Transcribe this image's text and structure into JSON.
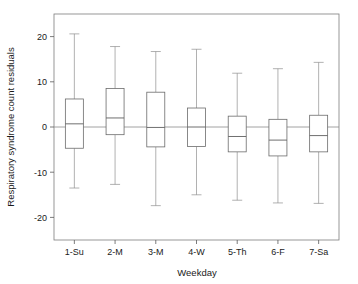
{
  "chart_data": {
    "type": "box",
    "title": "",
    "xlabel": "Weekday",
    "ylabel": "Respiratory syndrome count residuals",
    "categories": [
      "1-Su",
      "2-M",
      "3-M",
      "4-W",
      "5-Th",
      "6-F",
      "7-Sa"
    ],
    "ylim": [
      -25,
      25
    ],
    "yticks": [
      20,
      10,
      0,
      -10,
      -20
    ],
    "yticklabels": [
      "20",
      "10",
      "0",
      "-10",
      "-20"
    ],
    "grid": false,
    "legend": false,
    "zero_reference_line": 0,
    "boxes": [
      {
        "category": "1-Su",
        "whisker_low": -13.5,
        "q1": -4.7,
        "median": 0.7,
        "q3": 6.2,
        "whisker_high": 20.6
      },
      {
        "category": "2-M",
        "whisker_low": -12.7,
        "q1": -1.7,
        "median": 2.0,
        "q3": 8.5,
        "whisker_high": 17.8
      },
      {
        "category": "3-M",
        "whisker_low": -17.4,
        "q1": -4.4,
        "median": -0.1,
        "q3": 7.7,
        "whisker_high": 16.7
      },
      {
        "category": "4-W",
        "whisker_low": -15.0,
        "q1": -4.3,
        "median": 0.0,
        "q3": 4.2,
        "whisker_high": 17.2
      },
      {
        "category": "5-Th",
        "whisker_low": -16.2,
        "q1": -5.5,
        "median": -2.1,
        "q3": 2.4,
        "whisker_high": 11.9
      },
      {
        "category": "6-F",
        "whisker_low": -16.8,
        "q1": -6.4,
        "median": -2.9,
        "q3": 1.7,
        "whisker_high": 12.9
      },
      {
        "category": "7-Sa",
        "whisker_low": -16.9,
        "q1": -5.5,
        "median": -1.9,
        "q3": 2.6,
        "whisker_high": 14.3
      }
    ],
    "colors": {
      "box_stroke": "#6b6b6b",
      "box_fill": "#ffffff",
      "whisker": "#8f8f8f",
      "median": "#5f5f5f",
      "frame": "#7d7d7d",
      "zero_line": "#8a8a8a",
      "text": "#1a1a1a",
      "background": "#ffffff"
    }
  }
}
